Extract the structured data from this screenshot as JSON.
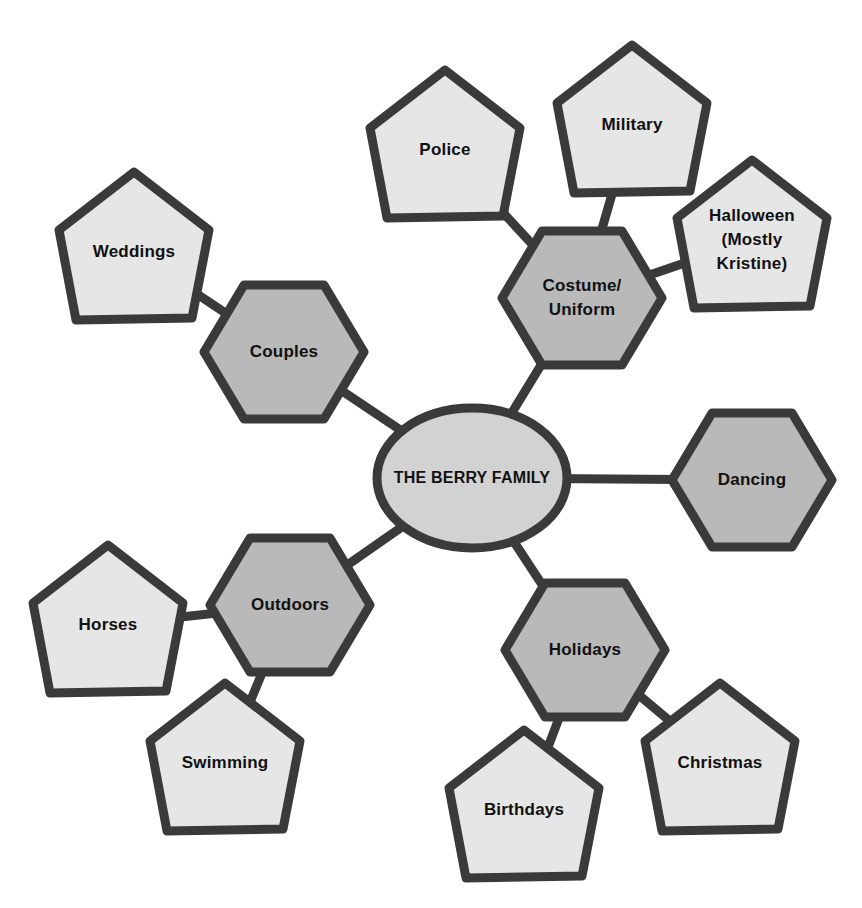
{
  "diagram": {
    "center": {
      "id": "berry-family",
      "label": "THE BERRY FAMILY",
      "shape": "ellipse",
      "x": 472,
      "y": 478
    },
    "categories": [
      {
        "id": "couples",
        "label": "Couples",
        "shape": "hexagon",
        "x": 284,
        "y": 352
      },
      {
        "id": "costume-uniform",
        "label": "Costume/\nUniform",
        "shape": "hexagon",
        "x": 582,
        "y": 298
      },
      {
        "id": "dancing",
        "label": "Dancing",
        "shape": "hexagon",
        "x": 752,
        "y": 480
      },
      {
        "id": "outdoors",
        "label": "Outdoors",
        "shape": "hexagon",
        "x": 290,
        "y": 605
      },
      {
        "id": "holidays",
        "label": "Holidays",
        "shape": "hexagon",
        "x": 585,
        "y": 650
      }
    ],
    "topics": [
      {
        "id": "weddings",
        "label": "Weddings",
        "parent": "couples",
        "shape": "pentagon",
        "x": 134,
        "y": 252
      },
      {
        "id": "police",
        "label": "Police",
        "parent": "costume-uniform",
        "shape": "pentagon",
        "x": 445,
        "y": 150
      },
      {
        "id": "military",
        "label": "Military",
        "parent": "costume-uniform",
        "shape": "pentagon",
        "x": 632,
        "y": 125
      },
      {
        "id": "halloween",
        "label": "Halloween\n(Mostly\nKristine)",
        "parent": "costume-uniform",
        "shape": "pentagon",
        "x": 752,
        "y": 240
      },
      {
        "id": "horses",
        "label": "Horses",
        "parent": "outdoors",
        "shape": "pentagon",
        "x": 108,
        "y": 625
      },
      {
        "id": "swimming",
        "label": "Swimming",
        "parent": "outdoors",
        "shape": "pentagon",
        "x": 225,
        "y": 763
      },
      {
        "id": "birthdays",
        "label": "Birthdays",
        "parent": "holidays",
        "shape": "pentagon",
        "x": 524,
        "y": 810
      },
      {
        "id": "christmas",
        "label": "Christmas",
        "parent": "holidays",
        "shape": "pentagon",
        "x": 720,
        "y": 763
      }
    ],
    "edges": [
      [
        "berry-family",
        "couples"
      ],
      [
        "berry-family",
        "costume-uniform"
      ],
      [
        "berry-family",
        "dancing"
      ],
      [
        "berry-family",
        "outdoors"
      ],
      [
        "berry-family",
        "holidays"
      ],
      [
        "couples",
        "weddings"
      ],
      [
        "costume-uniform",
        "police"
      ],
      [
        "costume-uniform",
        "military"
      ],
      [
        "costume-uniform",
        "halloween"
      ],
      [
        "outdoors",
        "horses"
      ],
      [
        "outdoors",
        "swimming"
      ],
      [
        "holidays",
        "birthdays"
      ],
      [
        "holidays",
        "christmas"
      ]
    ],
    "colors": {
      "stroke": "#3a3a3a",
      "center_fill": "#d2d2d2",
      "category_fill": "#b9b9b9",
      "topic_fill": "#e6e6e6",
      "background": "#ffffff"
    }
  }
}
